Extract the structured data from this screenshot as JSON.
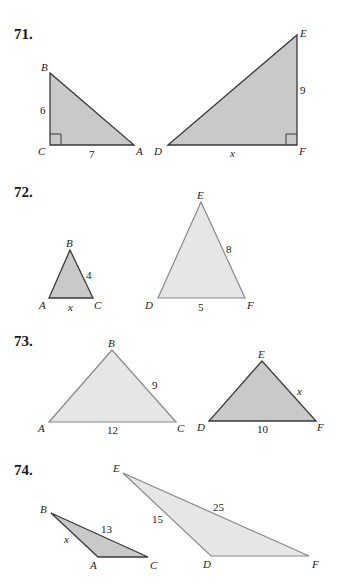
{
  "colors": {
    "dark_fill": "#c9c9c9",
    "dark_stroke": "#3a3a3a",
    "light_fill": "#e6e6e6",
    "light_stroke": "#8a8a8a"
  },
  "problems": [
    {
      "number": "71.",
      "triangle1": {
        "vertices": [
          "B",
          "C",
          "A"
        ],
        "labels": {
          "BC": "6",
          "CA": "7"
        },
        "right_angle": "C"
      },
      "triangle2": {
        "vertices": [
          "E",
          "D",
          "F"
        ],
        "labels": {
          "EF": "9",
          "DF": "x"
        },
        "right_angle": "F"
      }
    },
    {
      "number": "72.",
      "triangle1": {
        "vertices": [
          "B",
          "A",
          "C"
        ],
        "labels": {
          "BC": "4",
          "AC": "x"
        }
      },
      "triangle2": {
        "vertices": [
          "E",
          "D",
          "F"
        ],
        "labels": {
          "EF": "8",
          "DF": "5"
        }
      }
    },
    {
      "number": "73.",
      "triangle1": {
        "vertices": [
          "B",
          "A",
          "C"
        ],
        "labels": {
          "BC": "9",
          "AC": "12"
        }
      },
      "triangle2": {
        "vertices": [
          "E",
          "D",
          "F"
        ],
        "labels": {
          "EF": "x",
          "DF": "10"
        }
      }
    },
    {
      "number": "74.",
      "triangle1": {
        "vertices": [
          "B",
          "A",
          "C"
        ],
        "labels": {
          "BA": "x",
          "BC": "13"
        }
      },
      "triangle2": {
        "vertices": [
          "E",
          "D",
          "F"
        ],
        "labels": {
          "ED": "15",
          "EF": "25"
        }
      }
    }
  ]
}
